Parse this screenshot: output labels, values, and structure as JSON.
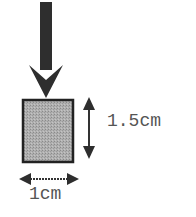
{
  "diagram": {
    "force_arrow": {
      "direction": "down",
      "color": "#2e2e2e"
    },
    "block": {
      "fill": "#a8a8a8",
      "stroke": "#222222"
    },
    "height_dimension": {
      "label": "1.5cm"
    },
    "width_dimension": {
      "label": "1cm"
    }
  }
}
